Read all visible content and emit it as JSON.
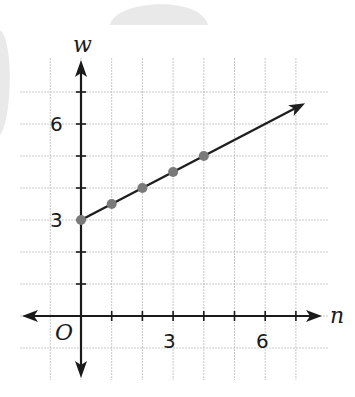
{
  "chart_data": {
    "type": "line",
    "title": "",
    "xlabel": "n",
    "ylabel": "w",
    "origin_label": "O",
    "x_tick_labels": [
      "3",
      "6"
    ],
    "y_tick_labels": [
      "3",
      "6"
    ],
    "xlim": [
      -1,
      7.5
    ],
    "ylim": [
      -1.5,
      7.5
    ],
    "grid": true,
    "series": [
      {
        "name": "w = 3 + 0.5n",
        "x": [
          0,
          1,
          2,
          3,
          4
        ],
        "y": [
          3,
          3.5,
          4,
          4.5,
          5
        ],
        "marker_color": "#7a7a7a",
        "line_color": "#1f1f1f",
        "extends_with_arrow": true,
        "arrow_end": [
          7.3,
          6.65
        ]
      }
    ]
  }
}
